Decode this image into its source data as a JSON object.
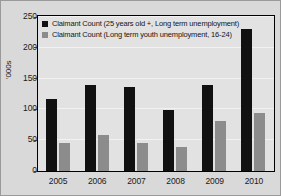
{
  "chart_data": {
    "type": "bar",
    "title": "",
    "xlabel": "",
    "ylabel": "'000s",
    "ylim": [
      0,
      250
    ],
    "yticks": [
      0,
      50,
      100,
      150,
      200,
      250
    ],
    "ytick_labels": [
      "0",
      "50",
      "100",
      "150",
      "200",
      "250"
    ],
    "grid": true,
    "legend_position": "top-left",
    "categories": [
      "2005",
      "2006",
      "2007",
      "2008",
      "2009",
      "2010"
    ],
    "series": [
      {
        "name": "Claimant Count (25 years old +, Long term unemployment)",
        "color": "#111111",
        "values": [
          117,
          139,
          136,
          99,
          140,
          231
        ]
      },
      {
        "name": "Claimant Count (Long term youth unemployment, 16-24)",
        "color": "#8c8c8c",
        "values": [
          45,
          59,
          46,
          39,
          82,
          94
        ]
      }
    ]
  },
  "legend": {
    "items": [
      {
        "label": "Claimant Count (25 years old +, Long term unemployment)",
        "swatch": "dark"
      },
      {
        "label": "Claimant Count (Long term youth unemployment, 16-24)",
        "swatch": "grey"
      }
    ]
  },
  "axes": {
    "y_title": "'000s"
  }
}
